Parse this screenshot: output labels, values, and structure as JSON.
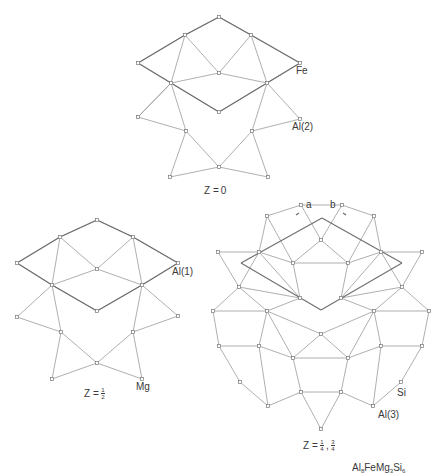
{
  "figure": {
    "formula": {
      "base": [
        "Al",
        "FeMg",
        "Si"
      ],
      "subs": [
        "8",
        "3",
        "6"
      ]
    },
    "colors": {
      "edge": "#9a9a9a",
      "cell": "#6e6e6e",
      "node_stroke": "#777777",
      "text": "#3a3a3a"
    },
    "panels": [
      {
        "id": "z0",
        "z_label": {
          "prefix": "Z = ",
          "value": "0"
        },
        "atom_labels": [
          {
            "text": "Fe",
            "x": 296,
            "y": 66
          },
          {
            "text": "Al(2)",
            "x": 292,
            "y": 122
          }
        ],
        "nodes": [
          [
            219,
            17
          ],
          [
            185,
            35
          ],
          [
            251,
            35
          ],
          [
            138,
            63
          ],
          [
            300,
            63
          ],
          [
            219,
            73
          ],
          [
            171,
            83
          ],
          [
            267,
            83
          ],
          [
            219,
            112
          ],
          [
            138,
            117
          ],
          [
            300,
            119
          ],
          [
            186,
            131
          ],
          [
            252,
            131
          ],
          [
            219,
            167
          ],
          [
            170,
            177
          ],
          [
            268,
            177
          ]
        ],
        "edges": [
          [
            0,
            1
          ],
          [
            0,
            2
          ],
          [
            1,
            3
          ],
          [
            2,
            4
          ],
          [
            1,
            5
          ],
          [
            2,
            5
          ],
          [
            1,
            6
          ],
          [
            2,
            7
          ],
          [
            3,
            6
          ],
          [
            4,
            7
          ],
          [
            6,
            5
          ],
          [
            5,
            7
          ],
          [
            6,
            8
          ],
          [
            7,
            8
          ],
          [
            6,
            9
          ],
          [
            7,
            10
          ],
          [
            9,
            6
          ],
          [
            6,
            11
          ],
          [
            7,
            12
          ],
          [
            11,
            13
          ],
          [
            12,
            13
          ],
          [
            11,
            14
          ],
          [
            12,
            15
          ],
          [
            13,
            14
          ],
          [
            13,
            15
          ],
          [
            10,
            12
          ],
          [
            9,
            11
          ]
        ],
        "cell_edges": [
          [
            0,
            1
          ],
          [
            0,
            2
          ],
          [
            1,
            3
          ],
          [
            2,
            4
          ],
          [
            3,
            6
          ],
          [
            4,
            7
          ],
          [
            6,
            8
          ],
          [
            7,
            8
          ]
        ]
      },
      {
        "id": "zhalf",
        "z_label": {
          "prefix": "Z = ",
          "num": "1",
          "den": "2"
        },
        "atom_labels": [
          {
            "text": "Al(1)",
            "x": 172,
            "y": 267
          },
          {
            "text": "Mg",
            "x": 136,
            "y": 382
          }
        ],
        "nodes": [
          [
            97,
            220
          ],
          [
            60,
            237
          ],
          [
            133,
            237
          ],
          [
            17,
            263
          ],
          [
            178,
            263
          ],
          [
            97,
            269
          ],
          [
            52,
            285
          ],
          [
            142,
            285
          ],
          [
            97,
            311
          ],
          [
            17,
            317
          ],
          [
            178,
            316
          ],
          [
            61,
            332
          ],
          [
            133,
            332
          ],
          [
            97,
            363
          ],
          [
            52,
            379
          ],
          [
            142,
            379
          ]
        ],
        "edges": [
          [
            0,
            1
          ],
          [
            0,
            2
          ],
          [
            1,
            3
          ],
          [
            2,
            4
          ],
          [
            1,
            5
          ],
          [
            2,
            5
          ],
          [
            1,
            6
          ],
          [
            2,
            7
          ],
          [
            3,
            6
          ],
          [
            4,
            7
          ],
          [
            6,
            5
          ],
          [
            5,
            7
          ],
          [
            6,
            8
          ],
          [
            7,
            8
          ],
          [
            6,
            9
          ],
          [
            7,
            10
          ],
          [
            6,
            11
          ],
          [
            7,
            12
          ],
          [
            11,
            13
          ],
          [
            12,
            13
          ],
          [
            11,
            14
          ],
          [
            12,
            15
          ],
          [
            13,
            14
          ],
          [
            13,
            15
          ],
          [
            9,
            11
          ],
          [
            10,
            12
          ]
        ],
        "cell_edges": [
          [
            0,
            1
          ],
          [
            0,
            2
          ],
          [
            1,
            3
          ],
          [
            2,
            4
          ],
          [
            3,
            6
          ],
          [
            4,
            7
          ],
          [
            6,
            8
          ],
          [
            7,
            8
          ]
        ]
      },
      {
        "id": "zquarter",
        "z_label": {
          "prefix": "Z = ",
          "num1": "1",
          "den1": "4",
          "num2": "3",
          "den2": "4"
        },
        "axis_labels": [
          {
            "text": "a",
            "x": 306,
            "y": 200
          },
          {
            "text": "b",
            "x": 330,
            "y": 200
          }
        ],
        "atom_labels": [
          {
            "text": "Si",
            "x": 397,
            "y": 388
          },
          {
            "text": "Al(3)",
            "x": 378,
            "y": 410
          }
        ],
        "nodes": [
          [
            301,
            205
          ],
          [
            342,
            205
          ],
          [
            267,
            216
          ],
          [
            374,
            216
          ],
          [
            321,
            240
          ],
          [
            218,
            252
          ],
          [
            259,
            252
          ],
          [
            381,
            252
          ],
          [
            422,
            252
          ],
          [
            293,
            263
          ],
          [
            348,
            263
          ],
          [
            239,
            287
          ],
          [
            402,
            287
          ],
          [
            300,
            298
          ],
          [
            341,
            298
          ],
          [
            213,
            311
          ],
          [
            267,
            311
          ],
          [
            374,
            311
          ],
          [
            429,
            311
          ],
          [
            321,
            334
          ],
          [
            219,
            346
          ],
          [
            259,
            346
          ],
          [
            381,
            346
          ],
          [
            422,
            346
          ],
          [
            293,
            358
          ],
          [
            348,
            358
          ],
          [
            240,
            382
          ],
          [
            401,
            382
          ],
          [
            301,
            392
          ],
          [
            341,
            392
          ],
          [
            268,
            406
          ],
          [
            373,
            406
          ],
          [
            321,
            429
          ]
        ],
        "edges": [
          [
            0,
            1
          ],
          [
            0,
            2
          ],
          [
            1,
            3
          ],
          [
            0,
            4
          ],
          [
            1,
            4
          ],
          [
            2,
            6
          ],
          [
            3,
            7
          ],
          [
            2,
            9
          ],
          [
            3,
            10
          ],
          [
            4,
            9
          ],
          [
            4,
            10
          ],
          [
            9,
            10
          ],
          [
            5,
            6
          ],
          [
            7,
            8
          ],
          [
            6,
            9
          ],
          [
            7,
            10
          ],
          [
            5,
            11
          ],
          [
            8,
            12
          ],
          [
            6,
            11
          ],
          [
            7,
            12
          ],
          [
            9,
            13
          ],
          [
            10,
            14
          ],
          [
            11,
            13
          ],
          [
            12,
            14
          ],
          [
            6,
            13
          ],
          [
            7,
            14
          ],
          [
            11,
            15
          ],
          [
            12,
            18
          ],
          [
            11,
            16
          ],
          [
            12,
            17
          ],
          [
            13,
            16
          ],
          [
            14,
            17
          ],
          [
            15,
            16
          ],
          [
            17,
            18
          ],
          [
            16,
            19
          ],
          [
            17,
            19
          ],
          [
            16,
            21
          ],
          [
            17,
            22
          ],
          [
            15,
            20
          ],
          [
            18,
            23
          ],
          [
            20,
            21
          ],
          [
            22,
            23
          ],
          [
            19,
            24
          ],
          [
            19,
            25
          ],
          [
            16,
            24
          ],
          [
            17,
            25
          ],
          [
            24,
            25
          ],
          [
            21,
            24
          ],
          [
            22,
            25
          ],
          [
            20,
            26
          ],
          [
            23,
            27
          ],
          [
            21,
            30
          ],
          [
            22,
            31
          ],
          [
            26,
            30
          ],
          [
            27,
            31
          ],
          [
            24,
            28
          ],
          [
            25,
            29
          ],
          [
            28,
            29
          ],
          [
            28,
            30
          ],
          [
            29,
            31
          ],
          [
            28,
            32
          ],
          [
            29,
            32
          ]
        ],
        "cell": [
          [
            322,
            218
          ],
          [
            402,
            263
          ],
          [
            321,
            310
          ],
          [
            241,
            263
          ]
        ],
        "arrows": [
          [
            [
              299,
              213
            ],
            [
              296,
              215
            ]
          ],
          [
            [
              343,
              213
            ],
            [
              346,
              215
            ]
          ]
        ]
      }
    ]
  }
}
